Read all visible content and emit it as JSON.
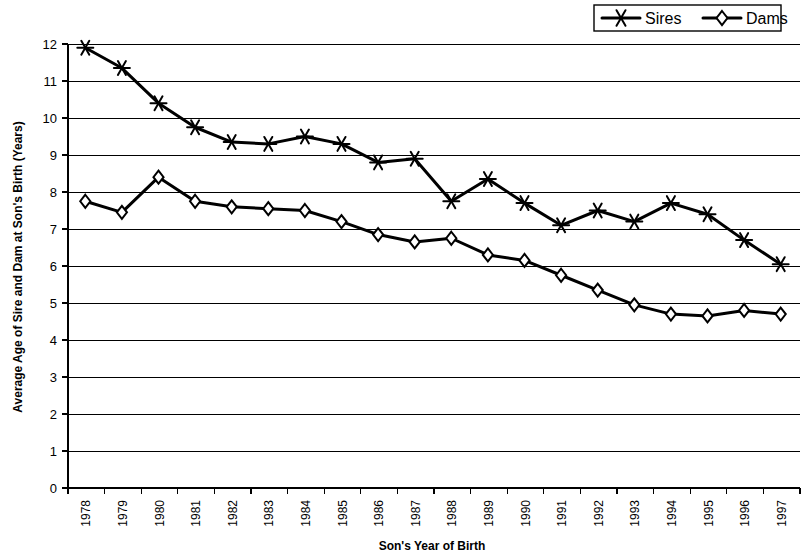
{
  "chart_data": {
    "type": "line",
    "title": "",
    "xlabel": "Son's Year of Birth",
    "ylabel": "Average Age of Sire and Dam at Son's Birth (Years)",
    "categories": [
      "1978",
      "1979",
      "1980",
      "1981",
      "1982",
      "1983",
      "1984",
      "1985",
      "1986",
      "1987",
      "1988",
      "1989",
      "1990",
      "1991",
      "1992",
      "1993",
      "1994",
      "1995",
      "1996",
      "1997"
    ],
    "x": [
      1978,
      1979,
      1980,
      1981,
      1982,
      1983,
      1984,
      1985,
      1986,
      1987,
      1988,
      1989,
      1990,
      1991,
      1992,
      1993,
      1994,
      1995,
      1996,
      1997
    ],
    "ylim": [
      0,
      12
    ],
    "yticks": [
      0,
      1,
      2,
      3,
      4,
      5,
      6,
      7,
      8,
      9,
      10,
      11,
      12
    ],
    "ytick_labels": [
      "0",
      "1",
      "2",
      "3",
      "4",
      "5",
      "6",
      "7",
      "8",
      "9",
      "10",
      "11",
      "12"
    ],
    "grid": "horizontal",
    "legend_position": "top-right",
    "series": [
      {
        "name": "Sires",
        "marker": "star",
        "color": "#000000",
        "values": [
          11.9,
          11.35,
          10.4,
          9.75,
          9.35,
          9.3,
          9.5,
          9.3,
          8.8,
          8.9,
          7.75,
          8.35,
          7.7,
          7.1,
          7.5,
          7.2,
          7.7,
          7.4,
          6.7,
          6.05
        ]
      },
      {
        "name": "Dams",
        "marker": "diamond",
        "color": "#000000",
        "values": [
          7.75,
          7.45,
          8.4,
          7.75,
          7.6,
          7.55,
          7.5,
          7.2,
          6.85,
          6.65,
          6.75,
          6.3,
          6.15,
          5.75,
          5.35,
          4.95,
          4.7,
          4.65,
          4.8,
          4.7
        ]
      }
    ]
  },
  "legend": {
    "items": [
      {
        "label": "Sires",
        "marker": "star-marker"
      },
      {
        "label": "Dams",
        "marker": "diamond-marker"
      }
    ]
  }
}
